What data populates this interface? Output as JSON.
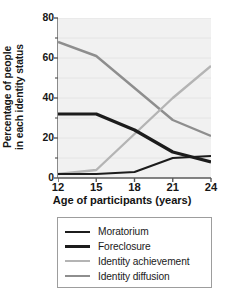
{
  "chart_data": {
    "type": "line",
    "title": "",
    "xlabel": "Age of participants (years)",
    "ylabel": "Percentage of people in each identity status",
    "ylabel_line1": "Percentage of people",
    "ylabel_line2": "in each identity status",
    "x": [
      12,
      15,
      18,
      21,
      24
    ],
    "xtick_labels": [
      "12",
      "15",
      "18",
      "21",
      "24"
    ],
    "ytick_labels": [
      "0",
      "20",
      "40",
      "60",
      "80"
    ],
    "ytick_values": [
      0,
      20,
      40,
      60,
      80
    ],
    "yminor_values": [
      10,
      30,
      50,
      70
    ],
    "xlim": [
      12,
      24
    ],
    "ylim": [
      0,
      80
    ],
    "grid": true,
    "grid_orientation": "horizontal",
    "legend_position": "below-axes",
    "plot_background": "#f1f1f1",
    "series": [
      {
        "name": "Moratorium",
        "color": "#1c1c1c",
        "width": 2.0,
        "values": [
          2,
          2,
          3,
          10,
          11
        ]
      },
      {
        "name": "Foreclosure",
        "color": "#1c1c1c",
        "width": 3.2,
        "values": [
          32,
          32,
          24,
          13,
          8
        ]
      },
      {
        "name": "Identity achievement",
        "color": "#b4b4b4",
        "width": 2.4,
        "values": [
          2,
          4,
          22,
          40,
          56
        ]
      },
      {
        "name": "Identity diffusion",
        "color": "#8e8e8e",
        "width": 2.4,
        "values": [
          68,
          61,
          45,
          29,
          21
        ]
      }
    ]
  },
  "legend": {
    "items": [
      {
        "label": "Moratorium"
      },
      {
        "label": "Foreclosure"
      },
      {
        "label": "Identity achievement"
      },
      {
        "label": "Identity diffusion"
      }
    ]
  },
  "colors": {
    "axis": "#5a5a5a",
    "text": "#171717",
    "legend_border": "#9d9d9d",
    "plot_bg": "#f1f1f1",
    "gridline": "#e4e4e4"
  }
}
